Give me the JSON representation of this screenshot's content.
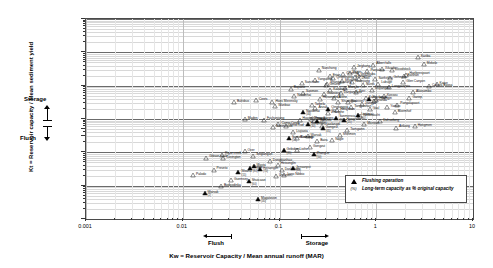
{
  "chart_data": {
    "type": "scatter",
    "title": "",
    "xlabel": "Kw = Reservoir Capacity / Mean annual runoff (MAR)",
    "ylabel": "Kt = Reservoir capacity / Mean sediment yield",
    "xscale": "log",
    "yscale": "log",
    "xlim": [
      0.001,
      10
    ],
    "ylim": [
      0.1,
      100000
    ],
    "grid": "horizontal-minor-log",
    "xticks": [
      "0.001",
      "0.01",
      "0.1",
      "1",
      "10"
    ],
    "yticks": [
      "0.1",
      "1",
      "10",
      "30",
      "50",
      "100",
      "1 000",
      "10 000",
      "100 000"
    ],
    "legend_position": "bottom-right",
    "legend": [
      {
        "marker": "filled-triangle",
        "label": "Flushing operation"
      },
      {
        "marker": "percent-text",
        "label": "Long-term capacity as % original capacity"
      }
    ],
    "annotations": {
      "y_axis_storage": "Storage",
      "y_axis_flush": "Flush",
      "x_axis_flush": "Flush",
      "x_axis_storage": "Storage"
    },
    "series": [
      {
        "name": "Reservoirs (non-flushing)",
        "marker": "open-triangle",
        "points": [
          {
            "label": "Gibson scale",
            "x": 0.0175,
            "y": 7.0
          },
          {
            "label": "Rigor creek",
            "x": 0.0255,
            "y": 8.5
          },
          {
            "label": "Covington",
            "x": 0.0262,
            "y": 6.6
          },
          {
            "label": "Palodo",
            "x": 0.0128,
            "y": 2.05
          },
          {
            "label": "Preveto",
            "x": 0.0208,
            "y": 3.05
          },
          {
            "label": "Guernsey",
            "x": 0.0315,
            "y": 1.45
          },
          {
            "label": "Bodgodinka",
            "x": 0.0248,
            "y": 0.98
          },
          {
            "label": "Over",
            "x": 0.0435,
            "y": 11.0
          },
          {
            "label": "Fuchunjiang",
            "x": 0.069,
            "y": 96.0
          },
          {
            "label": "Maden",
            "x": 0.0438,
            "y": 99.0
          },
          {
            "label": "Bultsbus",
            "x": 0.0338,
            "y": 320.0
          },
          {
            "label": "Ceres",
            "x": 0.057,
            "y": 370.0
          },
          {
            "label": "Hans Merensky",
            "x": 0.0845,
            "y": 330.0
          },
          {
            "label": "Wanbao",
            "x": 0.0905,
            "y": 245.0
          },
          {
            "label": "Singlangan",
            "x": 0.0535,
            "y": 8.0
          },
          {
            "label": "Dongbianhao",
            "x": 0.0795,
            "y": 5.4
          },
          {
            "label": "Heisonglin",
            "x": 0.096,
            "y": 4.3
          },
          {
            "label": "Camp Creek",
            "x": 0.0975,
            "y": 70.0
          },
          {
            "label": "Sanmenxia",
            "x": 0.0862,
            "y": 58.0
          },
          {
            "label": "Sefid Rud",
            "x": 0.118,
            "y": 60.0
          },
          {
            "label": "Liujiaxia",
            "x": 0.139,
            "y": 41.0
          },
          {
            "label": "Bushong",
            "x": 0.152,
            "y": 27.0
          },
          {
            "label": "Dashidaira",
            "x": 0.1055,
            "y": 2.9
          },
          {
            "label": "Lago Nibbio",
            "x": 0.112,
            "y": 2.1
          },
          {
            "label": "Unazuki",
            "x": 0.092,
            "y": 1.95
          },
          {
            "label": "Huangbizhuang",
            "x": 0.161,
            "y": 96.0
          },
          {
            "label": "Tangbu",
            "x": 0.226,
            "y": 89.0
          },
          {
            "label": "Gongzui",
            "x": 0.207,
            "y": 14.0
          },
          {
            "label": "Xiaolangdi",
            "x": 0.275,
            "y": 63.0
          },
          {
            "label": "Zhanghe",
            "x": 0.32,
            "y": 150.0
          },
          {
            "label": "Danjiangkou",
            "x": 0.43,
            "y": 610.0
          },
          {
            "label": "Guanting",
            "x": 0.288,
            "y": 560.0
          },
          {
            "label": "Liuxihe",
            "x": 0.365,
            "y": 430.0
          },
          {
            "label": "Xinanjiang",
            "x": 0.56,
            "y": 1250.0
          },
          {
            "label": "Ertan",
            "x": 0.33,
            "y": 1900.0
          },
          {
            "label": "Shuikou",
            "x": 0.44,
            "y": 1400.0
          },
          {
            "label": "Zhexi",
            "x": 0.66,
            "y": 1600.0
          },
          {
            "label": "Shangqiaotang",
            "x": 0.31,
            "y": 1150.0
          },
          {
            "label": "Miyun",
            "x": 0.53,
            "y": 2400.0
          },
          {
            "label": "Gezhouba",
            "x": 0.64,
            "y": 2050.0
          },
          {
            "label": "Jinghong",
            "x": 0.59,
            "y": 3600.0
          },
          {
            "label": "Panjiakou",
            "x": 0.81,
            "y": 2700.0
          },
          {
            "label": "Albert falls",
            "x": 0.93,
            "y": 4300.0
          },
          {
            "label": "Xiluodu",
            "x": 1.15,
            "y": 3200.0
          },
          {
            "label": "Nanchong",
            "x": 0.255,
            "y": 3050.0
          },
          {
            "label": "Churchill",
            "x": 0.455,
            "y": 2200.0
          },
          {
            "label": "Hartbeespoort",
            "x": 2.05,
            "y": 2150.0
          },
          {
            "label": "Woodstock",
            "x": 1.45,
            "y": 2950.0
          },
          {
            "label": "Mokolo",
            "x": 3.1,
            "y": 4500.0
          },
          {
            "label": "Kariba",
            "x": 2.7,
            "y": 7200.0
          },
          {
            "label": "Three Gorges",
            "x": 0.21,
            "y": 100.0
          },
          {
            "label": "Anzali",
            "x": 0.235,
            "y": 215.0
          },
          {
            "label": "Hengshan",
            "x": 0.395,
            "y": 185.0
          },
          {
            "label": "Tarbela",
            "x": 0.215,
            "y": 260.0
          },
          {
            "label": "Kalabagh",
            "x": 0.335,
            "y": 720.0
          },
          {
            "label": "Mangla",
            "x": 0.475,
            "y": 840.0
          },
          {
            "label": "Kerr",
            "x": 0.62,
            "y": 630.0
          },
          {
            "label": "Nurek",
            "x": 0.73,
            "y": 1050.0
          },
          {
            "label": "Wujiangdu",
            "x": 0.9,
            "y": 760.0
          },
          {
            "label": "Lubuge",
            "x": 1.05,
            "y": 1150.0
          },
          {
            "label": "Longyangxia",
            "x": 1.35,
            "y": 900.0
          },
          {
            "label": "Glen Canyon",
            "x": 1.9,
            "y": 1250.0
          },
          {
            "label": "Kainji",
            "x": 0.78,
            "y": 430.0
          },
          {
            "label": "Roseires",
            "x": 0.51,
            "y": 330.0
          },
          {
            "label": "Kossou",
            "x": 1.2,
            "y": 500.0
          },
          {
            "label": "Akosombo",
            "x": 2.4,
            "y": 640.0
          },
          {
            "label": "Cahora Bassa",
            "x": 3.5,
            "y": 980.0
          },
          {
            "label": "Inanda",
            "x": 0.95,
            "y": 340.0
          },
          {
            "label": "Pongolapoort",
            "x": 1.65,
            "y": 270.0
          },
          {
            "label": "Vaal",
            "x": 0.86,
            "y": 200.0
          },
          {
            "label": "Bloemhof",
            "x": 1.55,
            "y": 165.0
          },
          {
            "label": "Welbedacht",
            "x": 0.68,
            "y": 120.0
          },
          {
            "label": "Gariep",
            "x": 2.2,
            "y": 430.0
          },
          {
            "label": "Katse",
            "x": 4.2,
            "y": 1100.0
          },
          {
            "label": "Sanmen",
            "x": 0.175,
            "y": 620.0
          },
          {
            "label": "Naodehai",
            "x": 0.142,
            "y": 480.0
          },
          {
            "label": "Heisonglin B",
            "x": 0.26,
            "y": 410.0
          },
          {
            "label": "Warsak",
            "x": 0.195,
            "y": 31.0
          },
          {
            "label": "Baira",
            "x": 0.245,
            "y": 22.0
          },
          {
            "label": "Gmund",
            "x": 0.305,
            "y": 1050.0
          },
          {
            "label": "Shuangpai",
            "x": 0.405,
            "y": 330.0
          },
          {
            "label": "Tangjiashan",
            "x": 0.55,
            "y": 225.0
          },
          {
            "label": "Jiangya",
            "x": 0.71,
            "y": 280.0
          },
          {
            "label": "Huangjin",
            "x": 1.0,
            "y": 380.0
          },
          {
            "label": "Yantan",
            "x": 1.3,
            "y": 230.0
          },
          {
            "label": "Bajiazui",
            "x": 0.131,
            "y": 820.0
          },
          {
            "label": "Sanchahe",
            "x": 0.17,
            "y": 1200.0
          },
          {
            "label": "Yanguoxia",
            "x": 0.23,
            "y": 1450.0
          },
          {
            "label": "Qingtongxia",
            "x": 0.36,
            "y": 1650.0
          },
          {
            "label": "Fengman",
            "x": 0.6,
            "y": 1800.0
          },
          {
            "label": "Sanhekou",
            "x": 0.98,
            "y": 1550.0
          },
          {
            "label": "Geheyan",
            "x": 1.4,
            "y": 1700.0
          },
          {
            "label": "Baishan",
            "x": 1.95,
            "y": 1900.0
          },
          {
            "label": "Manwan",
            "x": 0.75,
            "y": 70.0
          },
          {
            "label": "Dahuofang",
            "x": 1.1,
            "y": 86.0
          },
          {
            "label": "Ankang",
            "x": 1.6,
            "y": 55.0
          },
          {
            "label": "Hongmen",
            "x": 2.5,
            "y": 62.0
          },
          {
            "label": "Tsengwen",
            "x": 0.5,
            "y": 46.0
          },
          {
            "label": "Shihmen",
            "x": 0.42,
            "y": 33.0
          },
          {
            "label": "Nagle",
            "x": 0.35,
            "y": 23.0
          },
          {
            "label": "Lixihe",
            "x": 0.15,
            "y": 11.5
          }
        ]
      },
      {
        "name": "Flushing operation",
        "marker": "filled-triangle",
        "points": [
          {
            "label": "Warsak",
            "pct": "(2)",
            "x": 0.0168,
            "y": 0.6
          },
          {
            "label": "Magatovon",
            "pct": "(40)",
            "x": 0.06,
            "y": 0.4
          },
          {
            "label": "Woana",
            "pct": "(15)",
            "x": 0.0375,
            "y": 2.55
          },
          {
            "label": "Worow",
            "pct": "(80)",
            "x": 0.0492,
            "y": 3.35
          },
          {
            "label": "Wasta",
            "pct": "(40)",
            "x": 0.054,
            "y": 3.95
          },
          {
            "label": "Heisonglin",
            "pct": "(70)",
            "x": 0.063,
            "y": 3.2
          },
          {
            "label": "Shuicaozi",
            "pct": "(60)",
            "x": 0.048,
            "y": 1.35
          },
          {
            "label": "Gebidem",
            "pct": "(85)",
            "x": 0.11,
            "y": 11.5
          },
          {
            "label": "Santo Domingo",
            "pct": "(50)",
            "x": 0.125,
            "y": 27.0
          },
          {
            "label": "Hengshan",
            "pct": "(30)",
            "x": 0.195,
            "y": 72.0
          },
          {
            "label": "Baojixia",
            "pct": "(45)",
            "x": 0.245,
            "y": 88.0
          },
          {
            "label": "Gongzui",
            "pct": "(35)",
            "x": 0.28,
            "y": 52.0
          },
          {
            "label": "Sanmenxia",
            "pct": "(55)",
            "x": 0.385,
            "y": 110.0
          },
          {
            "label": "Naodehai",
            "pct": "(40)",
            "x": 0.175,
            "y": 165.0
          },
          {
            "label": "Hengjinhe",
            "pct": "(25)",
            "x": 0.46,
            "y": 95.0
          },
          {
            "label": "Liujiaxia",
            "pct": "(60)",
            "x": 0.65,
            "y": 130.0
          },
          {
            "label": "Qingtongxia",
            "pct": "(20)",
            "x": 0.32,
            "y": 205.0
          },
          {
            "label": "Xiaolangdi",
            "pct": "(75)",
            "x": 0.85,
            "y": 410.0
          },
          {
            "label": "Jensanpei",
            "pct": "(65)",
            "x": 0.138,
            "y": 3.4
          },
          {
            "label": "Zhanghe",
            "pct": "(50)",
            "x": 0.225,
            "y": 8.8
          }
        ]
      }
    ]
  }
}
